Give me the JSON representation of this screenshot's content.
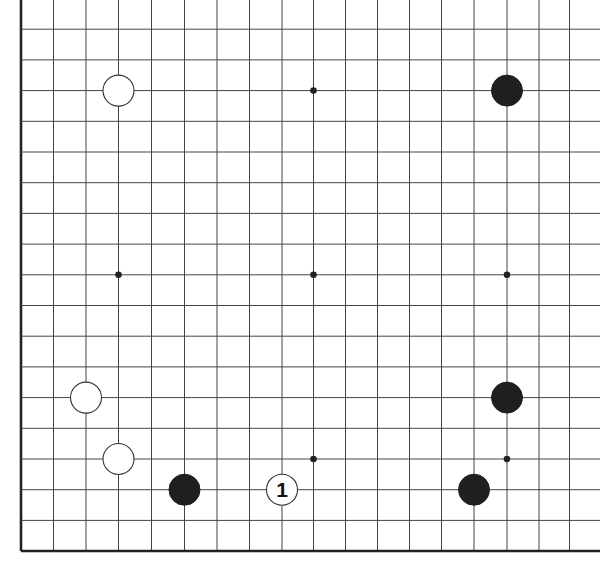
{
  "game": {
    "type": "go",
    "board_size": 19,
    "visible_region": "lower-left and right portion of board; top edge and rightmost column cropped",
    "colors": {
      "background": "#ffffff",
      "line": "#444444",
      "edge": "#222222",
      "black_stone": "#1f1f1f",
      "white_stone": "#ffffff",
      "star_point": "#222222"
    }
  },
  "grid": {
    "col_x": [
      21,
      53.5,
      86,
      118.5,
      151.5,
      184.5,
      217,
      249.5,
      282,
      313.5,
      345.5,
      377.5,
      409.5,
      441.5,
      474,
      507,
      539,
      569.5,
      601
    ],
    "row_y": [
      -1.5,
      29.2,
      59.9,
      90.6,
      121.3,
      152,
      182.7,
      213.4,
      244.1,
      274.8,
      305.5,
      336.2,
      366.9,
      397.6,
      428.3,
      459,
      489.7,
      520.4,
      551
    ],
    "left_edge_col": 0,
    "bottom_edge_row": 18
  },
  "star_points": [
    {
      "col": 3,
      "row": 3
    },
    {
      "col": 9,
      "row": 3
    },
    {
      "col": 15,
      "row": 3
    },
    {
      "col": 3,
      "row": 9
    },
    {
      "col": 9,
      "row": 9
    },
    {
      "col": 15,
      "row": 9
    },
    {
      "col": 3,
      "row": 15
    },
    {
      "col": 9,
      "row": 15
    },
    {
      "col": 15,
      "row": 15
    }
  ],
  "stones": [
    {
      "color": "white",
      "col": 3,
      "row": 3,
      "label": ""
    },
    {
      "color": "black",
      "col": 15,
      "row": 3,
      "label": ""
    },
    {
      "color": "white",
      "col": 2,
      "row": 13,
      "label": ""
    },
    {
      "color": "black",
      "col": 15,
      "row": 13,
      "label": ""
    },
    {
      "color": "white",
      "col": 3,
      "row": 15,
      "label": ""
    },
    {
      "color": "black",
      "col": 5,
      "row": 16,
      "label": ""
    },
    {
      "color": "white",
      "col": 8,
      "row": 16,
      "label": "1"
    },
    {
      "color": "black",
      "col": 14,
      "row": 16,
      "label": ""
    }
  ],
  "move_markers": [
    {
      "number": "1",
      "color": "white",
      "col": 8,
      "row": 16
    }
  ]
}
